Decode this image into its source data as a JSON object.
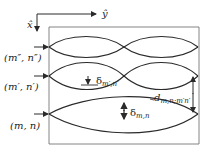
{
  "axes": {
    "x_label": "x̂",
    "y_label": "ŷ"
  },
  "modes": [
    {
      "id": "m2",
      "label": "(m″, n″)"
    },
    {
      "id": "m1",
      "label": "(m′, n′)"
    },
    {
      "id": "m0",
      "label": "(m, n)"
    }
  ],
  "annotations": {
    "delta_mn_prime": {
      "symbol": "δ",
      "subscript": "m′,n′"
    },
    "delta_mn": {
      "symbol": "δ",
      "subscript": "m,n"
    },
    "separation": {
      "symbol": "d",
      "subscript": "m,n;m′n′"
    }
  },
  "colors": {
    "line": "#2a2a2a",
    "frame": "#555555"
  }
}
